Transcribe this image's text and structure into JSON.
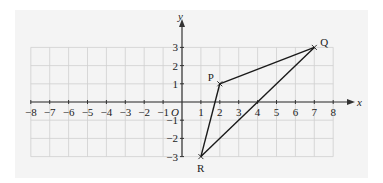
{
  "diagram": {
    "type": "coordinate-grid",
    "x_axis": {
      "label": "x",
      "min": -8,
      "max": 8,
      "ticks": [
        "−8",
        "−7",
        "−6",
        "−5",
        "−4",
        "−3",
        "−2",
        "−1",
        "1",
        "2",
        "3",
        "4",
        "5",
        "6",
        "7",
        "8"
      ]
    },
    "y_axis": {
      "label": "y",
      "min": -3,
      "max": 3,
      "ticks": [
        "3",
        "2",
        "1",
        "−1",
        "−2",
        "−3"
      ]
    },
    "origin_label": "O",
    "points": [
      {
        "name": "P",
        "x": 2,
        "y": 1
      },
      {
        "name": "Q",
        "x": 7,
        "y": 3
      },
      {
        "name": "R",
        "x": 1,
        "y": -3
      }
    ],
    "segments": [
      [
        "P",
        "Q"
      ],
      [
        "Q",
        "R"
      ],
      [
        "R",
        "P"
      ]
    ],
    "colors": {
      "panel": "#f4f4f4",
      "grid": "#cfcfcf",
      "axis": "#333333",
      "lines": "#1a1a1a"
    }
  }
}
